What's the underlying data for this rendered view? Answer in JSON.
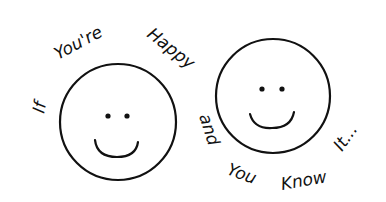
{
  "illustration": {
    "caption_words": [
      "If",
      "You're",
      "Happy",
      "and",
      "You",
      "Know",
      "It..."
    ],
    "faces": [
      {
        "name": "left-smiley-face",
        "cx": 118,
        "cy": 122,
        "r": 58
      },
      {
        "name": "right-smiley-face",
        "cx": 273,
        "cy": 96,
        "r": 57
      }
    ],
    "colors": {
      "ink": "#111111",
      "background": "#ffffff"
    }
  }
}
